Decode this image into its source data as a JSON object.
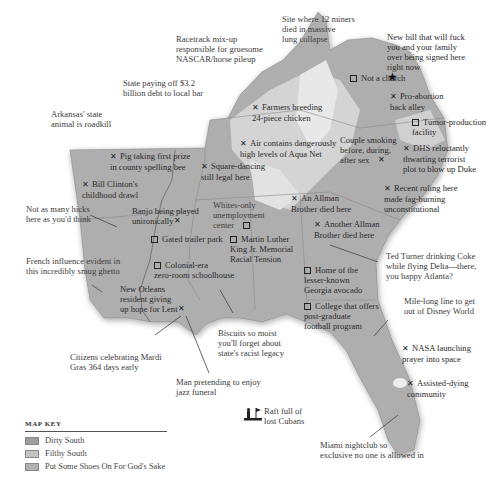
{
  "map": {
    "fill_colors": {
      "dirty_south": "#a8a8a8",
      "filthy_south": "#c8c8c8",
      "shoes": "#b8b8b8",
      "highland": "#e6e6e6",
      "water": "#ffffff"
    }
  },
  "annotations": [
    {
      "id": "racetrack",
      "marker": "none",
      "text": "Racetrack mix-up\nresponsible for gruesome\nNASCAR/horse pileup"
    },
    {
      "id": "miners",
      "marker": "none",
      "text": "Site where 12 miners\ndied in massive\nlung collapse"
    },
    {
      "id": "new-bill",
      "marker": "star",
      "text": "New bill that will fuck\nyou and your family\nover being signed here\nright now"
    },
    {
      "id": "debt",
      "marker": "none",
      "text": "State paying off $3.2\nbillion debt to local bar"
    },
    {
      "id": "arkansas",
      "marker": "none",
      "text": "Arkansas' state\nanimal is roadkill"
    },
    {
      "id": "not-church",
      "marker": "square",
      "text": "Not a church"
    },
    {
      "id": "pro-abortion",
      "marker": "x",
      "text": "Pro-abortion\nback alley"
    },
    {
      "id": "farmers",
      "marker": "x",
      "text": "Farmers breeding\n24-piece chicken"
    },
    {
      "id": "tumor",
      "marker": "square",
      "text": "Tumor-production\nfacility"
    },
    {
      "id": "pig",
      "marker": "x",
      "text": "Pig taking first prize\nin county spelling bee"
    },
    {
      "id": "aqua-net",
      "marker": "x",
      "text": "Air contains dangerously\nhigh levels of Aqua Net"
    },
    {
      "id": "couple",
      "marker": "x-after",
      "text": "Couple smoking\nbefore, during,\nafter sex"
    },
    {
      "id": "dhs",
      "marker": "x",
      "text": "DHS reluctantly\nthwarting terrorist\nplot to blow up Duke"
    },
    {
      "id": "clinton",
      "marker": "x",
      "text": "Bill Clinton's\nchildhood drawl"
    },
    {
      "id": "square-dancing",
      "marker": "x",
      "text": "Square-dancing\nstill legal here"
    },
    {
      "id": "recent-ruling",
      "marker": "x",
      "text": "Recent ruling here\nmade fag-burning\nunconstitutional"
    },
    {
      "id": "allman-1",
      "marker": "x",
      "text": "An Allman\nBrother died here"
    },
    {
      "id": "hicks",
      "marker": "none",
      "text": "Not as many hicks\nhere as you'd think"
    },
    {
      "id": "banjo",
      "marker": "x-after",
      "text": "Banjo being played\nunironically"
    },
    {
      "id": "whites-only",
      "marker": "square-after",
      "text": "Whites-only\nunemployment\ncenter"
    },
    {
      "id": "allman-2",
      "marker": "x",
      "text": "Another Allman\nBrother died here"
    },
    {
      "id": "gated",
      "marker": "square",
      "text": "Gated trailer park"
    },
    {
      "id": "mlk",
      "marker": "square",
      "text": "Martin Luther\nKing Jr. Memorial\nRacial Tension"
    },
    {
      "id": "ted-turner",
      "marker": "none",
      "text": "Ted Turner drinking Coke\nwhile flying Delta—there,\nyou happy Atlanta?"
    },
    {
      "id": "french",
      "marker": "none",
      "text": "French influence evident in\nthis incredibly smug ghetto"
    },
    {
      "id": "colonial",
      "marker": "square",
      "text": "Colonial-era\nzero-room schoolhouse"
    },
    {
      "id": "avocado",
      "marker": "square",
      "text": "Home of the\nlesser-known\nGeorgia avocado"
    },
    {
      "id": "new-orleans",
      "marker": "x-after",
      "text": "New Orleans\nresident giving\nup hope for Lent"
    },
    {
      "id": "college",
      "marker": "square",
      "text": "College that offers\npost-graduate\nfootball program"
    },
    {
      "id": "disney",
      "marker": "none",
      "text": "Mile-long line to get\nout of Disney World"
    },
    {
      "id": "biscuits",
      "marker": "none",
      "text": "Biscuits so moist\nyou'll forget about\nstate's racist legacy"
    },
    {
      "id": "mardi-gras",
      "marker": "none",
      "text": "Citizens celebrating Mardi\nGras 364 days early"
    },
    {
      "id": "nasa",
      "marker": "x",
      "text": "NASA launching\nprayer into space"
    },
    {
      "id": "jazz",
      "marker": "none",
      "text": "Man pretending to enjoy\njazz funeral"
    },
    {
      "id": "assisted",
      "marker": "x",
      "text": "Assisted-dying\ncommunity"
    },
    {
      "id": "raft",
      "marker": "raft",
      "text": "Raft full of\nlost Cubans"
    },
    {
      "id": "miami",
      "marker": "none",
      "text": "Miami nightclub so\nexclusive no one is allowed in"
    }
  ],
  "key": {
    "title": "MAP KEY",
    "items": [
      {
        "label": "Dirty South",
        "color": "#9e9e9e"
      },
      {
        "label": "Filthy South",
        "color": "#c4c4c4"
      },
      {
        "label": "Put Some Shoes On For God's Sake",
        "color": "#b0b0b0"
      }
    ]
  }
}
